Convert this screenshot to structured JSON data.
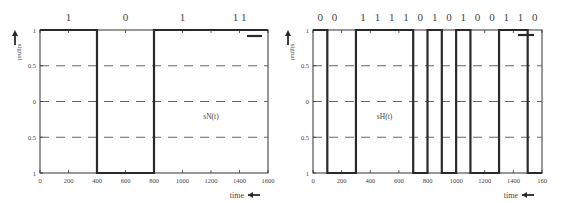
{
  "chart_data": [
    {
      "type": "line",
      "title": "",
      "signal_label": "sN(t)",
      "xlabel": "time",
      "ylabel": "signal",
      "xlim": [
        0,
        1600
      ],
      "ylim": [
        -1,
        1
      ],
      "x_ticks": [
        "0",
        "200",
        "400",
        "600",
        "800",
        "1000",
        "1200",
        "1400",
        "1600"
      ],
      "y_ticks": [
        "1",
        "0.5",
        "0",
        "0.5",
        "1"
      ],
      "grid": "dashed horizontal at 0.5, 0, -0.5",
      "bit_labels": [
        {
          "label": "1",
          "x": 200
        },
        {
          "label": "0",
          "x": 600
        },
        {
          "label": "1",
          "x": 1000
        },
        {
          "label": "1 1",
          "x": 1400
        }
      ],
      "x": [
        0,
        400,
        400,
        800,
        800,
        1600
      ],
      "y": [
        1,
        1,
        -1,
        -1,
        1,
        1
      ],
      "segments": [
        {
          "from": 0,
          "to": 400,
          "level": 1
        },
        {
          "from": 400,
          "to": 800,
          "level": -1
        },
        {
          "from": 800,
          "to": 1600,
          "level": 1
        }
      ]
    },
    {
      "type": "line",
      "title": "",
      "signal_label": "sH(t)",
      "xlabel": "time",
      "ylabel": "signal",
      "xlim": [
        0,
        1600
      ],
      "ylim": [
        -1,
        1
      ],
      "x_ticks": [
        "0",
        "200",
        "400",
        "600",
        "800",
        "1000",
        "1200",
        "1400",
        "160"
      ],
      "y_ticks": [
        "1",
        "0.5",
        "0",
        "0.5",
        "1"
      ],
      "grid": "dashed horizontal at 0.5, 0, -0.5",
      "bit_labels": [
        {
          "label": "0",
          "x": 50
        },
        {
          "label": "0",
          "x": 150
        },
        {
          "label": "1",
          "x": 350
        },
        {
          "label": "1",
          "x": 450
        },
        {
          "label": "1",
          "x": 550
        },
        {
          "label": "1",
          "x": 650
        },
        {
          "label": "0",
          "x": 750
        },
        {
          "label": "1",
          "x": 850
        },
        {
          "label": "0",
          "x": 950
        },
        {
          "label": "1",
          "x": 1050
        },
        {
          "label": "0",
          "x": 1150
        },
        {
          "label": "0",
          "x": 1250
        },
        {
          "label": "1",
          "x": 1350
        },
        {
          "label": "1",
          "x": 1450
        },
        {
          "label": "0",
          "x": 1550
        }
      ],
      "segments": [
        {
          "from": 0,
          "to": 100,
          "level": 1
        },
        {
          "from": 100,
          "to": 300,
          "level": -1
        },
        {
          "from": 300,
          "to": 700,
          "level": 1
        },
        {
          "from": 700,
          "to": 800,
          "level": -1
        },
        {
          "from": 800,
          "to": 900,
          "level": 1
        },
        {
          "from": 900,
          "to": 1000,
          "level": -1
        },
        {
          "from": 1000,
          "to": 1100,
          "level": 1
        },
        {
          "from": 1100,
          "to": 1300,
          "level": -1
        },
        {
          "from": 1300,
          "to": 1500,
          "level": 1
        },
        {
          "from": 1500,
          "to": 1600,
          "level": -1
        }
      ]
    }
  ],
  "panels": [
    {
      "left": 40,
      "right": 268,
      "top": 30,
      "bottom": 173,
      "legend_marker": "dash"
    },
    {
      "left": 313,
      "right": 542,
      "top": 30,
      "bottom": 173,
      "legend_marker": "cross"
    }
  ],
  "colors": {
    "signal": "#2a2a2a",
    "axis": "#333333",
    "grid": "#555555",
    "text": "#444444"
  }
}
